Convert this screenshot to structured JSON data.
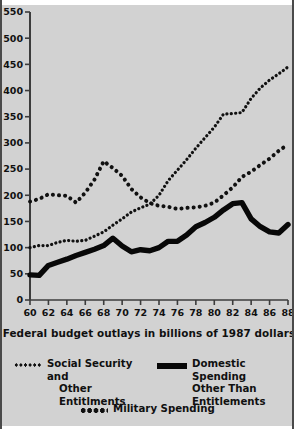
{
  "caption": "Federal budget outlays in billions of 1987 dollars",
  "legend": {
    "social_security": {
      "line1": "Social Security and",
      "line2": "Other Entitlments",
      "swatch": "fine-dotted-line-swatch"
    },
    "domestic": {
      "line1": "Domestic Spending",
      "line2": "Other Than",
      "line3": "Entitlements",
      "swatch": "solid-bold-line-swatch"
    },
    "military": {
      "line1": "Military Spending",
      "swatch": "coarse-dotted-line-swatch"
    }
  },
  "chart_data": {
    "type": "line",
    "title": "",
    "subtitle": "",
    "xlabel": "Federal budget outlays in billions of 1987 dollars",
    "ylabel": "",
    "xlim": [
      60,
      88
    ],
    "ylim": [
      0,
      550
    ],
    "xticks": [
      60,
      62,
      64,
      66,
      68,
      70,
      72,
      74,
      76,
      78,
      80,
      82,
      84,
      86,
      88
    ],
    "yticks": [
      0,
      50,
      100,
      150,
      200,
      250,
      300,
      350,
      400,
      450,
      500,
      550
    ],
    "xtick_labels": [
      "60",
      "62",
      "64",
      "66",
      "68",
      "70",
      "72",
      "74",
      "76",
      "78",
      "80",
      "82",
      "84",
      "86",
      "88"
    ],
    "ytick_labels": [
      "0",
      "50",
      "100",
      "150",
      "200",
      "250",
      "300",
      "350",
      "400",
      "450",
      "500",
      "550"
    ],
    "grid": false,
    "legend_position": "below-plot",
    "x": [
      60,
      61,
      62,
      63,
      64,
      65,
      66,
      67,
      68,
      69,
      70,
      71,
      72,
      73,
      74,
      75,
      76,
      77,
      78,
      79,
      80,
      81,
      82,
      83,
      84,
      85,
      86,
      87,
      88
    ],
    "series": [
      {
        "name": "Social Security and Other Entitlments",
        "style": "fine-dotted",
        "color": "#111111",
        "values": [
          100,
          104,
          104,
          110,
          114,
          112,
          114,
          122,
          130,
          143,
          155,
          168,
          176,
          183,
          200,
          228,
          248,
          268,
          290,
          310,
          330,
          355,
          356,
          358,
          385,
          405,
          420,
          432,
          445
        ]
      },
      {
        "name": "Military Spending",
        "style": "coarse-dotted",
        "color": "#111111",
        "values": [
          188,
          193,
          202,
          200,
          199,
          186,
          205,
          230,
          265,
          252,
          237,
          212,
          196,
          185,
          180,
          178,
          174,
          176,
          177,
          180,
          186,
          200,
          215,
          235,
          245,
          258,
          270,
          285,
          297
        ]
      },
      {
        "name": "Domestic Spending Other Than Entitlements",
        "style": "solid-bold",
        "color": "#080808",
        "values": [
          48,
          47,
          66,
          72,
          78,
          85,
          91,
          97,
          104,
          118,
          103,
          92,
          96,
          94,
          100,
          112,
          112,
          124,
          140,
          148,
          158,
          172,
          184,
          186,
          155,
          140,
          130,
          128,
          144
        ]
      }
    ],
    "annotations": []
  }
}
